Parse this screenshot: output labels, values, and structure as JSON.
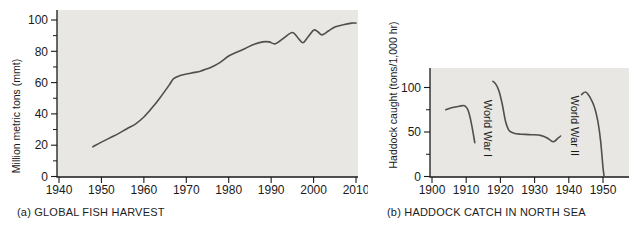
{
  "colors": {
    "plot_bg": "#e9e7e3",
    "curve": "#4f4f4f",
    "axis": "#1a1a1a",
    "text": "#1a1a1a"
  },
  "chart_data": [
    {
      "id": "global-fish-harvest",
      "type": "line",
      "title": "(a) GLOBAL FISH HARVEST",
      "xlabel": "",
      "ylabel": "Million metric tons (mmt)",
      "xlim": [
        1940,
        2010
      ],
      "ylim": [
        0,
        106
      ],
      "grid": false,
      "legend": "none",
      "x_ticks": [
        1940,
        1950,
        1960,
        1970,
        1980,
        1990,
        2000,
        2010
      ],
      "y_ticks_major": [
        0,
        20,
        40,
        60,
        80,
        100
      ],
      "y_ticks_minor": [
        10,
        30,
        50,
        70,
        90
      ],
      "series": [
        {
          "name": "global-fish-harvest-mmt",
          "points": [
            [
              1948,
              19
            ],
            [
              1950,
              22
            ],
            [
              1953,
              26
            ],
            [
              1956,
              30.5
            ],
            [
              1958,
              33.5
            ],
            [
              1960,
              38
            ],
            [
              1962,
              44
            ],
            [
              1964,
              51
            ],
            [
              1966,
              58.5
            ],
            [
              1967,
              62.5
            ],
            [
              1968.5,
              64.5
            ],
            [
              1970,
              65.5
            ],
            [
              1972,
              66.5
            ],
            [
              1973.5,
              67.5
            ],
            [
              1976,
              70
            ],
            [
              1978,
              73
            ],
            [
              1980,
              77
            ],
            [
              1982,
              79.5
            ],
            [
              1984,
              82
            ],
            [
              1986,
              84.5
            ],
            [
              1988,
              86
            ],
            [
              1989.5,
              86
            ],
            [
              1991,
              84.8
            ],
            [
              1993,
              88.5
            ],
            [
              1995,
              92
            ],
            [
              1996.5,
              88
            ],
            [
              1997.5,
              85.5
            ],
            [
              1998.5,
              88.5
            ],
            [
              2000,
              93.5
            ],
            [
              2001,
              92.5
            ],
            [
              2002,
              90.5
            ],
            [
              2003.5,
              93
            ],
            [
              2005,
              95.5
            ],
            [
              2007,
              97
            ],
            [
              2009,
              98
            ],
            [
              2010,
              98
            ]
          ]
        }
      ],
      "annotations": []
    },
    {
      "id": "haddock-catch-north-sea",
      "type": "line",
      "title": "(b) HADDOCK CATCH IN NORTH SEA",
      "xlabel": "",
      "ylabel": "Haddock caught (tons/1,000 hr)",
      "xlim": [
        1900,
        1958
      ],
      "ylim": [
        0,
        122
      ],
      "grid": false,
      "legend": "none",
      "x_ticks": [
        1900,
        1910,
        1920,
        1930,
        1940,
        1950
      ],
      "y_ticks_major": [
        0,
        50,
        100
      ],
      "y_ticks_minor": [
        25,
        75
      ],
      "series": [
        {
          "name": "pre-world-war-1",
          "points": [
            [
              1904,
              75
            ],
            [
              1906,
              77.5
            ],
            [
              1908,
              79
            ],
            [
              1909.5,
              79.5
            ],
            [
              1910.5,
              75
            ],
            [
              1911.5,
              60
            ],
            [
              1912.5,
              38
            ]
          ]
        },
        {
          "name": "interwar",
          "points": [
            [
              1917.8,
              107
            ],
            [
              1918.6,
              104
            ],
            [
              1919.5,
              97
            ],
            [
              1920.5,
              82
            ],
            [
              1921.5,
              62
            ],
            [
              1922.5,
              52
            ],
            [
              1924,
              48.5
            ],
            [
              1926,
              47.5
            ],
            [
              1929,
              47
            ],
            [
              1932,
              46
            ],
            [
              1934,
              42.5
            ],
            [
              1935.5,
              39
            ],
            [
              1936.8,
              43
            ],
            [
              1937.6,
              45.5
            ]
          ]
        },
        {
          "name": "post-world-war-2",
          "points": [
            [
              1943.7,
              92
            ],
            [
              1944.7,
              95
            ],
            [
              1945.5,
              93
            ],
            [
              1946.5,
              87
            ],
            [
              1947.5,
              78
            ],
            [
              1948.5,
              62
            ],
            [
              1949.3,
              40
            ],
            [
              1950,
              10
            ],
            [
              1950.3,
              1
            ]
          ]
        }
      ],
      "annotations": [
        {
          "text": "World War I",
          "x": 1916.3,
          "y": 54,
          "rotate": 90
        },
        {
          "text": "World War II",
          "x": 1941.7,
          "y": 57,
          "rotate": 90
        }
      ]
    }
  ]
}
